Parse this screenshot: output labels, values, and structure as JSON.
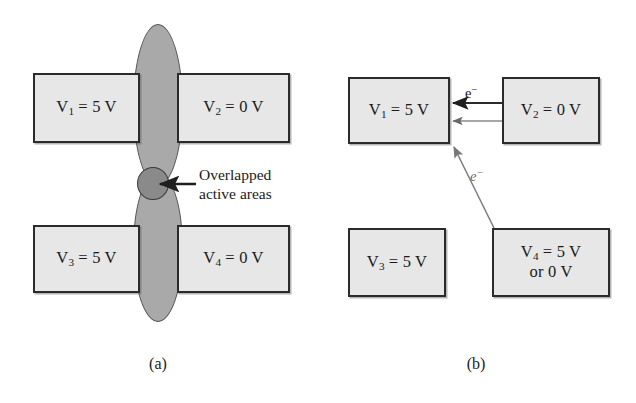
{
  "figure": {
    "caption_a": "(a)",
    "caption_b": "(b)"
  },
  "panel_a": {
    "electrodes": [
      {
        "id": "v1",
        "text": "V",
        "sub": "1",
        "rest": " = 5 V"
      },
      {
        "id": "v2",
        "text": "V",
        "sub": "2",
        "rest": " = 0 V"
      },
      {
        "id": "v3",
        "text": "V",
        "sub": "3",
        "rest": " = 5 V"
      },
      {
        "id": "v4",
        "text": "V",
        "sub": "4",
        "rest": " = 0 V"
      }
    ],
    "annotation": {
      "line1": "Overlapped",
      "line2": "active areas"
    },
    "colors": {
      "electrode_fill": "#e7e7e7",
      "electrode_border": "#2b2b2b",
      "ellipse_fill": "#a9a9a9",
      "overlap_fill": "#8a8a8a"
    }
  },
  "panel_b": {
    "electrodes": [
      {
        "id": "v1",
        "text": "V",
        "sub": "1",
        "rest": " = 5 V",
        "line2": ""
      },
      {
        "id": "v2",
        "text": "V",
        "sub": "2",
        "rest": " = 0 V",
        "line2": ""
      },
      {
        "id": "v3",
        "text": "V",
        "sub": "3",
        "rest": " = 5 V",
        "line2": ""
      },
      {
        "id": "v4",
        "text": "V",
        "sub": "4",
        "rest": " = 5 V",
        "line2": "or 0 V"
      }
    ],
    "electron_label_top": "e",
    "electron_label_top_sup": "−",
    "electron_label_diag": "e",
    "electron_label_diag_sup": "−"
  }
}
